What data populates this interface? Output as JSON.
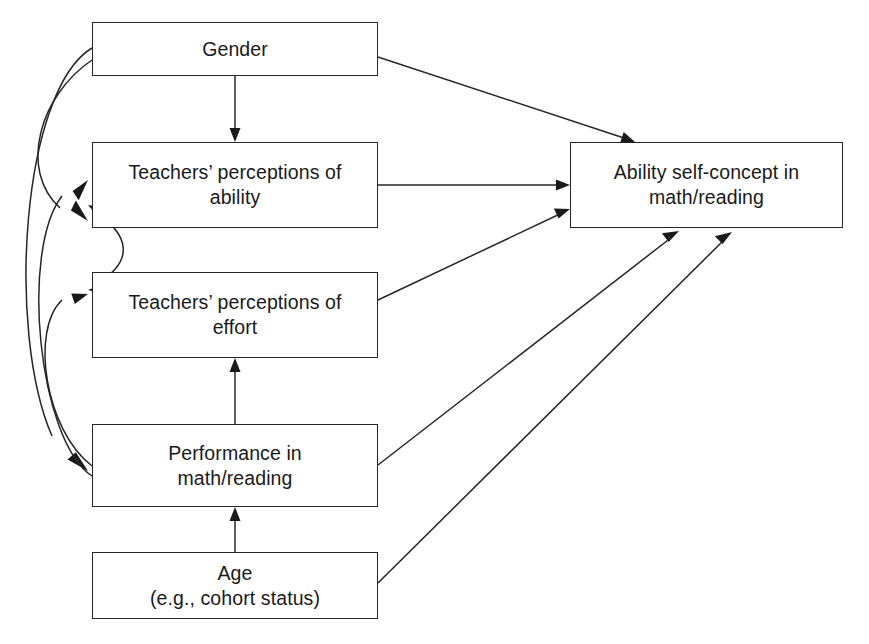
{
  "diagram": {
    "type": "path-diagram",
    "canvas": {
      "width": 869,
      "height": 644
    },
    "colors": {
      "stroke": "#262626",
      "text": "#1a1a1a",
      "background": "#ffffff"
    },
    "nodes": [
      {
        "id": "gender",
        "label": "Gender",
        "x": 92,
        "y": 22,
        "w": 286,
        "h": 54
      },
      {
        "id": "teacher_ability",
        "label": "Teachers’ perceptions of\nability",
        "x": 92,
        "y": 142,
        "w": 286,
        "h": 86
      },
      {
        "id": "teacher_effort",
        "label": "Teachers’ perceptions of\neffort",
        "x": 92,
        "y": 272,
        "w": 286,
        "h": 86
      },
      {
        "id": "performance",
        "label": "Performance in\nmath/reading",
        "x": 92,
        "y": 424,
        "w": 286,
        "h": 83
      },
      {
        "id": "age",
        "label": "Age\n(e.g., cohort status)",
        "x": 92,
        "y": 552,
        "w": 286,
        "h": 67
      },
      {
        "id": "self_concept",
        "label": "Ability self-concept in\nmath/reading",
        "x": 570,
        "y": 142,
        "w": 273,
        "h": 86
      }
    ],
    "edges": [
      {
        "id": "e1",
        "from": "gender",
        "to": "teacher_ability",
        "style": "straight-vertical",
        "arrows": "single"
      },
      {
        "id": "e2",
        "from": "gender",
        "to": "self_concept",
        "style": "straight-diagonal",
        "arrows": "single"
      },
      {
        "id": "e3",
        "from": "teacher_ability",
        "to": "self_concept",
        "style": "straight-horizontal",
        "arrows": "single"
      },
      {
        "id": "e4",
        "from": "teacher_effort",
        "to": "self_concept",
        "style": "straight-diagonal",
        "arrows": "single"
      },
      {
        "id": "e5",
        "from": "performance",
        "to": "self_concept",
        "style": "straight-diagonal",
        "arrows": "single"
      },
      {
        "id": "e6",
        "from": "age",
        "to": "self_concept",
        "style": "straight-diagonal",
        "arrows": "single"
      },
      {
        "id": "e7",
        "from": "age",
        "to": "performance",
        "style": "straight-vertical",
        "arrows": "single"
      },
      {
        "id": "e8",
        "from": "performance",
        "to": "teacher_effort",
        "style": "straight-vertical",
        "arrows": "single"
      },
      {
        "id": "e9",
        "from": "gender",
        "to": "teacher_ability",
        "style": "curved-left",
        "arrows": "single"
      },
      {
        "id": "e10",
        "from": "gender",
        "to": "performance",
        "style": "curved-left",
        "arrows": "single"
      },
      {
        "id": "e11",
        "from": "performance",
        "to": "teacher_ability",
        "style": "curved-left",
        "arrows": "single"
      },
      {
        "id": "e12",
        "from": "performance",
        "to": "teacher_effort",
        "style": "curved-left",
        "arrows": "single"
      },
      {
        "id": "e13",
        "from": "teacher_ability",
        "to": "teacher_effort",
        "style": "curved-double",
        "arrows": "double"
      }
    ]
  }
}
